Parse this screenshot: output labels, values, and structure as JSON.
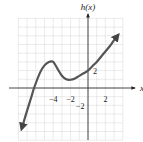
{
  "chart_data": {
    "type": "line",
    "title": "",
    "xlabel": "x",
    "ylabel": "h(x)",
    "xlim": [
      -8,
      4
    ],
    "ylim": [
      -6,
      8
    ],
    "grid": true,
    "x_ticks_labeled": [
      -4,
      -2,
      2
    ],
    "y_ticks_labeled": [
      2,
      -2
    ],
    "tick_labels": {
      "x": [
        "−4",
        "−2",
        "2"
      ],
      "y": [
        "2",
        "−2"
      ]
    },
    "series": [
      {
        "name": "h(x)",
        "points": [
          [
            -7.6,
            -4.6
          ],
          [
            -7,
            -2.6
          ],
          [
            -6.5,
            -1
          ],
          [
            -6.2,
            0
          ],
          [
            -5.5,
            1.8
          ],
          [
            -5,
            2.6
          ],
          [
            -4.5,
            3.0
          ],
          [
            -4,
            3.0
          ],
          [
            -3.5,
            2.2
          ],
          [
            -3,
            1.4
          ],
          [
            -2.5,
            1.0
          ],
          [
            -2,
            0.95
          ],
          [
            -1.5,
            1.1
          ],
          [
            -1,
            1.4
          ],
          [
            -0.5,
            1.7
          ],
          [
            0,
            2.0
          ],
          [
            0.5,
            2.5
          ],
          [
            1,
            3.0
          ],
          [
            1.5,
            3.6
          ],
          [
            2,
            4.2
          ],
          [
            2.5,
            4.8
          ],
          [
            3,
            5.5
          ],
          [
            3.4,
            6.0
          ]
        ],
        "arrow_ends": true
      }
    ],
    "key_points": {
      "local_max": [
        -4,
        3
      ],
      "local_min": [
        -2,
        1
      ],
      "y_intercept": [
        0,
        2
      ],
      "x_intercept": [
        -6.2,
        0
      ]
    }
  }
}
